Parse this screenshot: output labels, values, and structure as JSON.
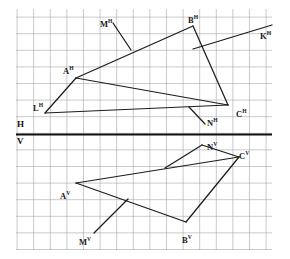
{
  "figure": {
    "type": "descriptive-geometry-projection",
    "width": 290,
    "height": 259,
    "background_color": "#ffffff",
    "line_color": "#1d1d1d",
    "grid": {
      "minor_color": "#cfcfd6",
      "major_color": "#8f8f99",
      "minor_spacing_px": 3.32,
      "major_every_n": 5,
      "left": 16,
      "top": 9,
      "right": 272,
      "bottom": 250
    },
    "ground_line": {
      "label_above": "H",
      "label_below": "V",
      "y": 134.5,
      "x_start": 16,
      "x_end": 272,
      "color": "#111111",
      "thickness_px": 1.9
    },
    "axis_labels": [
      {
        "name": "h-label",
        "text": "H",
        "x": 17,
        "y": 120
      },
      {
        "name": "v-label",
        "text": "V",
        "x": 17,
        "y": 137
      }
    ],
    "labels": [
      {
        "name": "label-m-h",
        "base": "M",
        "sup": "H",
        "x": 100,
        "y": 20
      },
      {
        "name": "label-b-h",
        "base": "B",
        "sup": "H",
        "x": 188,
        "y": 16
      },
      {
        "name": "label-k-h",
        "base": "K",
        "sup": "H",
        "x": 260,
        "y": 32
      },
      {
        "name": "label-a-h",
        "base": "A",
        "sup": "H",
        "x": 63,
        "y": 67
      },
      {
        "name": "label-l-h",
        "base": "L",
        "sup": "H",
        "x": 33,
        "y": 104
      },
      {
        "name": "label-n-h",
        "base": "N",
        "sup": "H",
        "x": 207,
        "y": 119
      },
      {
        "name": "label-c-h",
        "base": "C",
        "sup": "H",
        "x": 236,
        "y": 110
      },
      {
        "name": "label-n-v",
        "base": "N",
        "sup": "V",
        "x": 207,
        "y": 143
      },
      {
        "name": "label-c-v",
        "base": "C",
        "sup": "V",
        "x": 239,
        "y": 152
      },
      {
        "name": "label-a-v",
        "base": "A",
        "sup": "V",
        "x": 60,
        "y": 192
      },
      {
        "name": "label-m-v",
        "base": "M",
        "sup": "V",
        "x": 79,
        "y": 238
      },
      {
        "name": "label-b-v",
        "base": "B",
        "sup": "V",
        "x": 182,
        "y": 236
      }
    ],
    "polylines": [
      {
        "name": "line-a-b-h",
        "points": "76,78 193,26"
      },
      {
        "name": "line-b-c-h",
        "points": "193,26 228,105"
      },
      {
        "name": "line-b-k-h",
        "points": "193,49 272,25"
      },
      {
        "name": "line-a-c-h",
        "points": "76,78 228,105"
      },
      {
        "name": "line-a-l-h",
        "points": "76,78 45,113"
      },
      {
        "name": "line-l-c-h",
        "points": "45,113 228,105"
      },
      {
        "name": "leader-m-h",
        "points": "113,23 131,50"
      },
      {
        "name": "leader-n-h",
        "points": "189,107 205,124"
      },
      {
        "name": "line-a-c-v",
        "points": "76,183 239,157"
      },
      {
        "name": "line-a-b-v",
        "points": "76,183 186,222"
      },
      {
        "name": "line-b-c-v",
        "points": "186,222 239,157"
      },
      {
        "name": "leader-n-v",
        "points": "202,145 165,168"
      },
      {
        "name": "line-n-c-v",
        "points": "202,145 239,157"
      },
      {
        "name": "leader-m-v",
        "points": "94,233 128,199"
      }
    ]
  }
}
